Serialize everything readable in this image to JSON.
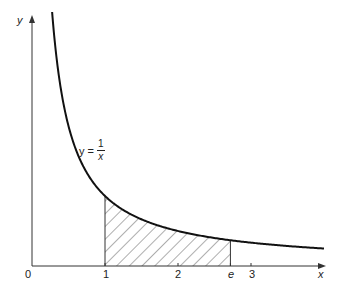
{
  "chart_data": {
    "type": "line",
    "title": "",
    "function": "y = 1/x",
    "xlabel": "x",
    "ylabel": "y",
    "x_ticks": [
      {
        "value": 1,
        "label": "1"
      },
      {
        "value": 2,
        "label": "2"
      },
      {
        "value": 2.718,
        "label": "e"
      },
      {
        "value": 3,
        "label": "3"
      }
    ],
    "origin_label": "0",
    "curve_label": {
      "lhs": "y =",
      "num": "1",
      "den": "x"
    },
    "shaded_region": {
      "from": 1,
      "to": 2.718,
      "pattern": "diagonal-hatch",
      "description": "area under y=1/x from 1 to e"
    },
    "series": [
      {
        "name": "y = 1/x",
        "x": [
          0.07,
          0.1,
          0.15,
          0.2,
          0.3,
          0.5,
          0.75,
          1,
          1.5,
          2,
          2.5,
          2.718,
          3,
          3.5,
          4
        ],
        "values": [
          14.3,
          10,
          6.67,
          5,
          3.33,
          2,
          1.33,
          1,
          0.67,
          0.5,
          0.4,
          0.368,
          0.333,
          0.286,
          0.25
        ]
      }
    ],
    "xlim": [
      0,
      4.0
    ],
    "ylim": [
      0,
      3.6
    ],
    "grid": false,
    "legend": "none"
  },
  "labels": {
    "y_axis": "y",
    "x_axis": "x",
    "origin": "0",
    "tick_1": "1",
    "tick_2": "2",
    "tick_e": "e",
    "tick_3": "3",
    "eq_lhs": "y =",
    "eq_num": "1",
    "eq_den": "x"
  }
}
